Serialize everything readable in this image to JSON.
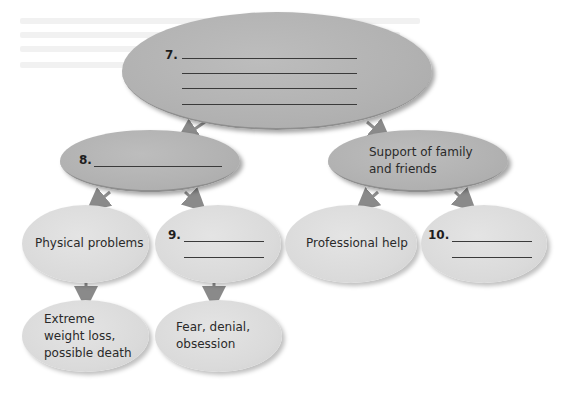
{
  "diagram": {
    "type": "concept-map",
    "colors": {
      "upper_node": "#b4b4b4",
      "lower_node": "#dcdcdc",
      "arrow": "#8a8a8a",
      "text": "#2a2a2a"
    },
    "root": {
      "number": "7.",
      "blank_lines": 4,
      "text": ""
    },
    "level2": [
      {
        "id": "n8",
        "number": "8.",
        "blank_lines": 1,
        "text": ""
      },
      {
        "id": "support",
        "number": "",
        "blank_lines": 0,
        "text": "Support of family\nand friends"
      }
    ],
    "level3": [
      {
        "id": "physical",
        "parent": "n8",
        "number": "",
        "text": "Physical problems"
      },
      {
        "id": "n9",
        "parent": "n8",
        "number": "9.",
        "blank_lines": 2,
        "text": ""
      },
      {
        "id": "professional",
        "parent": "support",
        "number": "",
        "text": "Professional help"
      },
      {
        "id": "n10",
        "parent": "support",
        "number": "10.",
        "blank_lines": 2,
        "text": ""
      }
    ],
    "level4": [
      {
        "id": "extreme",
        "parent": "physical",
        "text": "Extreme\nweight loss,\npossible death"
      },
      {
        "id": "fear",
        "parent": "n9",
        "text": "Fear, denial,\nobsession"
      }
    ]
  },
  "nodes": {
    "root_number": "7.",
    "n8_number": "8.",
    "support_text": "Support of family\nand friends",
    "physical_text": "Physical problems",
    "n9_number": "9.",
    "professional_text": "Professional help",
    "n10_number": "10.",
    "extreme_text": "Extreme\nweight loss,\npossible death",
    "fear_text": "Fear, denial,\nobsession"
  }
}
